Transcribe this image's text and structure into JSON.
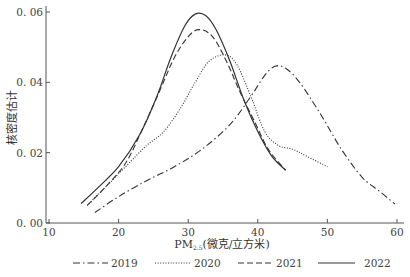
{
  "chart_data": {
    "type": "line",
    "title": "",
    "xlabel": "PM",
    "xlabel_sub": "2.5",
    "xlabel_unit": "(微克/立方米)",
    "ylabel": "核密度估计",
    "xlim": [
      10,
      60
    ],
    "ylim": [
      0.0,
      0.06
    ],
    "xticks": [
      "10",
      "20",
      "30",
      "40",
      "50",
      "60"
    ],
    "yticks": [
      "0.00",
      "0.02",
      "0.04",
      "0.06"
    ],
    "grid": false,
    "legend_position": "bottom",
    "series": [
      {
        "name": "2019",
        "style": "dashdot",
        "x": [
          16.6,
          20,
          24,
          28,
          32,
          36,
          39,
          41,
          42.5,
          44,
          46,
          49,
          52,
          55,
          57.5,
          59.7
        ],
        "y": [
          0.003,
          0.0075,
          0.012,
          0.016,
          0.021,
          0.028,
          0.036,
          0.042,
          0.0446,
          0.044,
          0.04,
          0.031,
          0.021,
          0.013,
          0.009,
          0.0054
        ]
      },
      {
        "name": "2020",
        "style": "dotted",
        "x": [
          15.5,
          18,
          21,
          24,
          26.5,
          29,
          31,
          33,
          35.3,
          37,
          39,
          41,
          43,
          45,
          47,
          50
        ],
        "y": [
          0.005,
          0.01,
          0.016,
          0.022,
          0.026,
          0.033,
          0.04,
          0.046,
          0.0478,
          0.045,
          0.036,
          0.026,
          0.022,
          0.021,
          0.019,
          0.016
        ]
      },
      {
        "name": "2021",
        "style": "dashed",
        "x": [
          15.5,
          18,
          21,
          23.5,
          26,
          28,
          30,
          31.6,
          33.5,
          35.5,
          37.5,
          39.5,
          41.5,
          44
        ],
        "y": [
          0.005,
          0.01,
          0.017,
          0.027,
          0.038,
          0.047,
          0.053,
          0.055,
          0.053,
          0.046,
          0.037,
          0.029,
          0.021,
          0.015
        ]
      },
      {
        "name": "2022",
        "style": "solid",
        "x": [
          14.6,
          17,
          20,
          23,
          25.5,
          27.5,
          29.5,
          31,
          32.5,
          34,
          36,
          38,
          40,
          42,
          44
        ],
        "y": [
          0.0055,
          0.01,
          0.016,
          0.025,
          0.036,
          0.047,
          0.056,
          0.0594,
          0.059,
          0.055,
          0.046,
          0.035,
          0.026,
          0.019,
          0.015
        ]
      }
    ]
  },
  "legend": {
    "items": [
      {
        "label": "2019"
      },
      {
        "label": "2020"
      },
      {
        "label": "2021"
      },
      {
        "label": "2022"
      }
    ]
  }
}
